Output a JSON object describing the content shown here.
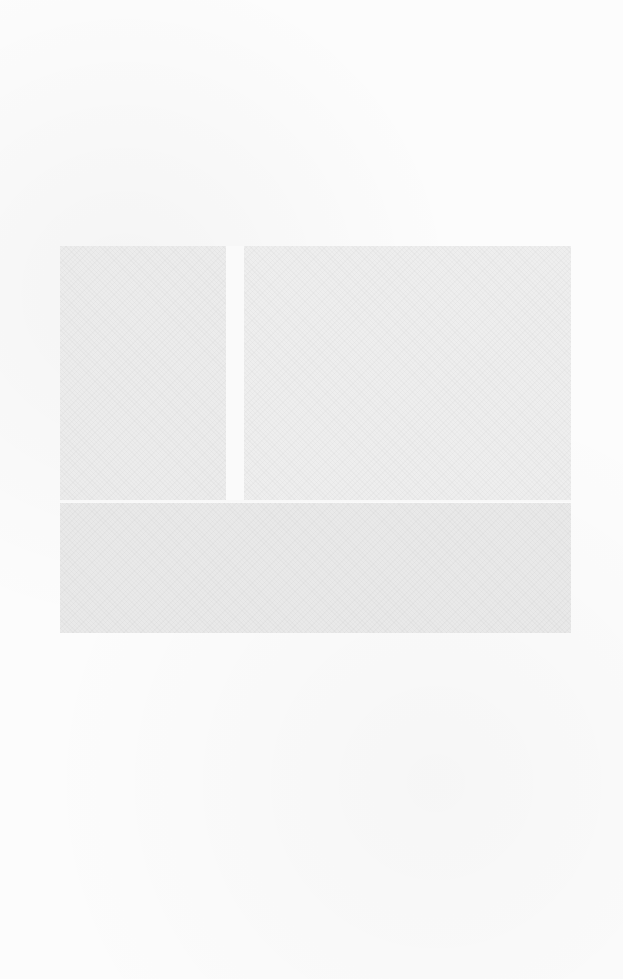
{
  "page": {
    "type": "scanned-blank-page",
    "background_color": "#fcfcfc",
    "regions": [
      {
        "name": "left-panel",
        "color": "#ececec"
      },
      {
        "name": "right-panel",
        "color": "#eeeeee"
      },
      {
        "name": "bottom-panel",
        "color": "#e9e9e9"
      }
    ],
    "caption": ""
  }
}
